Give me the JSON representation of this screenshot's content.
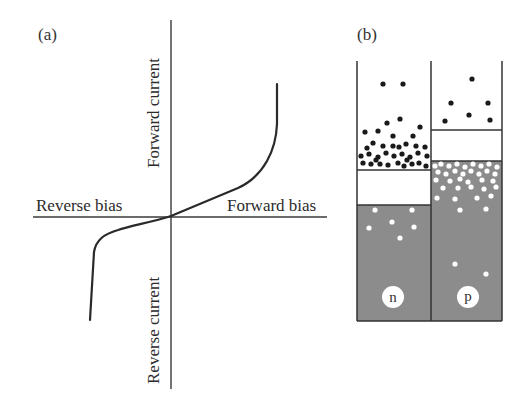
{
  "panel_a": {
    "label": "(a)",
    "y_axis_top_label": "Forward current",
    "y_axis_bottom_label": "Reverse current",
    "x_axis_left_label": "Reverse bias",
    "x_axis_right_label": "Forward bias",
    "curve_description": "Diode I-V characteristic: steep forward rise at right, breakdown drop at left"
  },
  "panel_b": {
    "label": "(b)",
    "regions": [
      {
        "name": "n",
        "badge": "n"
      },
      {
        "name": "p",
        "badge": "p"
      }
    ],
    "colors": {
      "valence_band_fill": "#8c8c8c",
      "electron": "#1a1a1a",
      "hole": "#ffffff"
    }
  }
}
